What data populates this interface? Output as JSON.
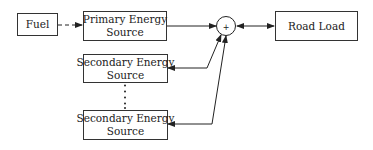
{
  "diagram": {
    "nodes": {
      "fuel": {
        "label": "Fuel"
      },
      "primary": {
        "line1": "Primary Energy",
        "line2": "Source"
      },
      "secondary_1": {
        "line1": "Secondary Energy",
        "line2": "Source"
      },
      "secondary_n": {
        "line1": "Secondary Energy",
        "line2": "Source"
      },
      "summing_junction": {
        "symbol": "+"
      },
      "road_load": {
        "label": "Road Load"
      }
    },
    "edges": [
      {
        "from": "fuel",
        "to": "primary",
        "style": "dashed",
        "direction": "forward"
      },
      {
        "from": "primary",
        "to": "summing_junction",
        "style": "solid",
        "direction": "forward"
      },
      {
        "from": "summing_junction",
        "to": "secondary_1",
        "style": "solid",
        "direction": "bidirectional"
      },
      {
        "from": "summing_junction",
        "to": "secondary_n",
        "style": "solid",
        "direction": "bidirectional"
      },
      {
        "from": "summing_junction",
        "to": "road_load",
        "style": "solid",
        "direction": "bidirectional"
      }
    ],
    "ellipsis": "vertical dots between secondary sources"
  }
}
